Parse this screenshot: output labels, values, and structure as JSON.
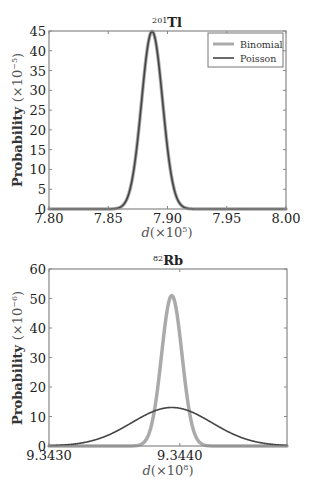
{
  "chart_data": [
    {
      "type": "line",
      "title": "201Tl",
      "title_sup": "201",
      "title_main": "Tl",
      "xlabel": "d(×10^5)",
      "xlabel_text": "d(×10",
      "xlabel_exp": "5",
      "ylabel": "Probability (×10^-5)",
      "ylabel_text": "Probability (×10",
      "ylabel_exp": "−5",
      "xlim": [
        7.8,
        8.0
      ],
      "ylim": [
        0,
        45
      ],
      "xticks": [
        "7.80",
        "7.85",
        "7.90",
        "7.95",
        "8.00"
      ],
      "xtick_values": [
        7.8,
        7.85,
        7.9,
        7.95,
        8.0
      ],
      "yticks": [
        "0",
        "5",
        "10",
        "15",
        "20",
        "25",
        "30",
        "35",
        "40",
        "45"
      ],
      "ytick_values": [
        0,
        5,
        10,
        15,
        20,
        25,
        30,
        35,
        40,
        45
      ],
      "grid": false,
      "legend_position": "upper right",
      "series": [
        {
          "name": "Binomial",
          "color": "#aaaaaa",
          "width": 3.5,
          "mean": 7.887,
          "sigma": 0.00888,
          "peak": 44.9,
          "x": [
            7.8,
            7.85,
            7.86,
            7.87,
            7.875,
            7.88,
            7.885,
            7.887,
            7.89,
            7.895,
            7.9,
            7.91,
            7.92,
            7.95,
            8.0
          ],
          "y": [
            0.0,
            0.1,
            1.4,
            7.7,
            18.3,
            33.0,
            43.9,
            44.9,
            42.3,
            29.6,
            15.1,
            1.5,
            0.05,
            0.0,
            0.0
          ]
        },
        {
          "name": "Poisson",
          "color": "#444444",
          "width": 1.6,
          "mean": 7.887,
          "sigma": 0.00888,
          "peak": 44.9,
          "x": [
            7.8,
            7.85,
            7.86,
            7.87,
            7.875,
            7.88,
            7.885,
            7.887,
            7.89,
            7.895,
            7.9,
            7.91,
            7.92,
            7.95,
            8.0
          ],
          "y": [
            0.0,
            0.1,
            1.4,
            7.7,
            18.3,
            33.0,
            43.9,
            44.9,
            42.3,
            29.6,
            15.1,
            1.5,
            0.05,
            0.0,
            0.0
          ]
        }
      ]
    },
    {
      "type": "line",
      "title": "82Rb",
      "title_sup": "82",
      "title_main": "Rb",
      "xlabel": "d(×10^8)",
      "xlabel_text": "d(×10",
      "xlabel_exp": "8",
      "ylabel": "Probability (×10^-6)",
      "ylabel_text": "Probability (×10",
      "ylabel_exp": "−6",
      "xlim": [
        9.343,
        9.34482
      ],
      "ylim": [
        0,
        60
      ],
      "xticks": [
        "9.3430",
        "9.3440"
      ],
      "xtick_values": [
        9.343,
        9.344
      ],
      "yticks": [
        "0",
        "10",
        "20",
        "30",
        "40",
        "50",
        "60"
      ],
      "ytick_values": [
        0,
        10,
        20,
        30,
        40,
        50,
        60
      ],
      "grid": false,
      "series": [
        {
          "name": "Binomial",
          "color": "#aaaaaa",
          "width": 3.5,
          "mean": 9.343939,
          "sigma": 7.82e-05,
          "peak": 51.0,
          "x": [
            9.3437,
            9.3438,
            9.34385,
            9.3439,
            9.343939,
            9.34398,
            9.34403,
            9.34408,
            9.3442
          ],
          "y": [
            0.5,
            10.7,
            28.1,
            45.1,
            51.0,
            44.6,
            26.7,
            10.0,
            0.3
          ]
        },
        {
          "name": "Poisson",
          "color": "#444444",
          "width": 1.6,
          "mean": 9.343939,
          "sigma": 0.000306,
          "peak": 13.05,
          "x": [
            9.343,
            9.3432,
            9.3434,
            9.3436,
            9.3438,
            9.343939,
            9.3441,
            9.3443,
            9.3445,
            9.34482
          ],
          "y": [
            0.1,
            0.9,
            3.4,
            7.9,
            11.8,
            13.05,
            11.6,
            7.1,
            2.9,
            0.4
          ]
        }
      ]
    }
  ],
  "legend": {
    "items": [
      {
        "label": "Binomial",
        "color": "#aaaaaa"
      },
      {
        "label": "Poisson",
        "color": "#444444"
      }
    ]
  }
}
